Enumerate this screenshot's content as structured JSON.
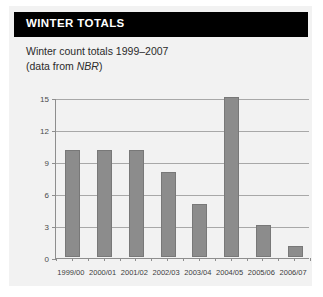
{
  "header": {
    "title": "WINTER TOTALS"
  },
  "subtitle": {
    "line1": "Winter count totals 1999–2007",
    "line2_prefix": "(data from ",
    "line2_italic": "NBR",
    "line2_suffix": ")"
  },
  "colors": {
    "header_background": "#000000",
    "header_text": "#ffffff",
    "card_background": "#f2f2f2",
    "page_background": "#ffffff",
    "bar_fill": "#8c8c8c",
    "bar_stroke": "#787878",
    "gridline": "#a8a8a8",
    "axis": "#8e8e8e"
  },
  "chart_data": {
    "type": "bar",
    "title": "Winter count totals 1999–2007",
    "xlabel": "",
    "ylabel": "",
    "categories": [
      "1999/00",
      "2000/01",
      "2001/02",
      "2002/03",
      "2003/04",
      "2004/05",
      "2005/06",
      "2006/07"
    ],
    "values": [
      10,
      10,
      10,
      8,
      5,
      15,
      3,
      1
    ],
    "ylim": [
      0,
      15
    ],
    "yticks": [
      0,
      3,
      6,
      9,
      12,
      15
    ],
    "ytick_labels": [
      "0",
      "3",
      "6",
      "9",
      "12",
      "15"
    ],
    "grid": true,
    "legend": false,
    "annotations": [
      "(data from NBR)"
    ]
  }
}
